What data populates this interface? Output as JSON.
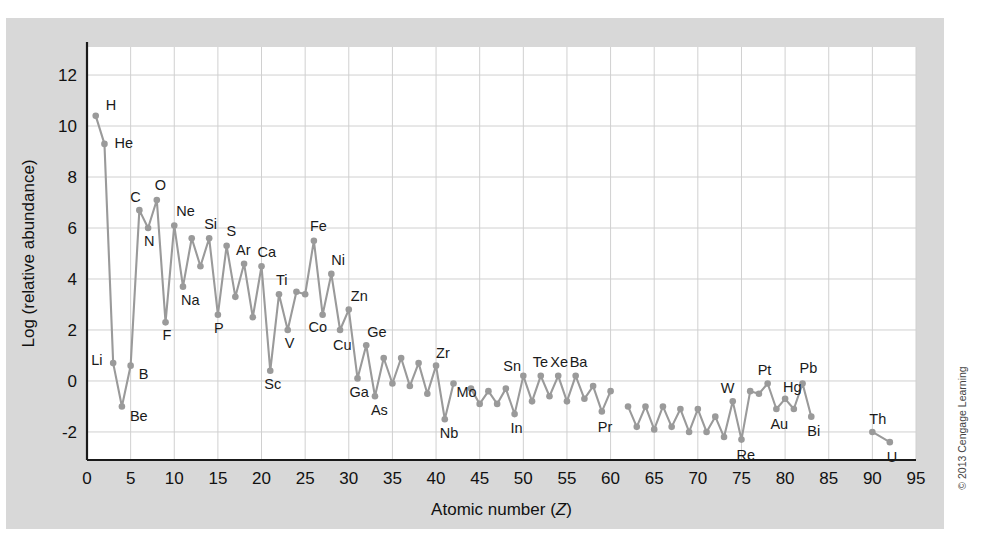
{
  "figure": {
    "credit": "© 2013 Cengage Learning",
    "background_color": "#d8d8d8",
    "plot_background_color": "#ffffff",
    "series_color": "#9a9a9a",
    "grid_color": "#d0d0d0",
    "axis_color": "#1a1a1a"
  },
  "chart_data": {
    "type": "line",
    "title": "",
    "subtitle": "",
    "xlabel": "Atomic number (Z)",
    "ylabel": "Log (relative abundance)",
    "xlim": [
      0,
      95
    ],
    "ylim": [
      -3.1,
      13.1
    ],
    "xticks": [
      0,
      5,
      10,
      15,
      20,
      25,
      30,
      35,
      40,
      45,
      50,
      55,
      60,
      65,
      70,
      75,
      80,
      85,
      90,
      95
    ],
    "yticks": [
      -2,
      0,
      2,
      4,
      6,
      8,
      10,
      12
    ],
    "grid": true,
    "legend": "none",
    "marker": "circle",
    "series": [
      {
        "name": "Solar system abundance",
        "x": [
          1,
          2,
          3,
          4,
          5,
          6,
          7,
          8,
          9,
          10,
          11,
          12,
          13,
          14,
          15,
          16,
          17,
          18,
          19,
          20,
          21,
          22,
          23,
          24,
          25,
          26,
          27,
          28,
          29,
          30,
          31,
          32,
          33,
          34,
          35,
          36,
          37,
          38,
          39,
          40,
          41,
          42
        ],
        "values": [
          10.4,
          9.3,
          0.7,
          -1.0,
          0.6,
          6.7,
          6.0,
          7.1,
          2.3,
          6.1,
          3.7,
          5.6,
          4.5,
          5.6,
          2.6,
          5.3,
          3.3,
          4.6,
          2.5,
          4.5,
          0.4,
          3.4,
          2.0,
          3.5,
          3.4,
          5.5,
          2.6,
          4.2,
          2.0,
          2.8,
          0.1,
          1.4,
          -0.6,
          0.9,
          -0.1,
          0.9,
          -0.2,
          0.7,
          -0.5,
          0.6,
          -1.5,
          -0.1
        ]
      },
      {
        "name": "Solar system abundance (continued)",
        "x": [
          44,
          45,
          46,
          47,
          48,
          49,
          50,
          51,
          52,
          53,
          54,
          55,
          56,
          57,
          58,
          59,
          60
        ],
        "values": [
          -0.3,
          -0.9,
          -0.4,
          -0.9,
          -0.3,
          -1.3,
          0.2,
          -0.8,
          0.2,
          -0.6,
          0.2,
          -0.8,
          0.2,
          -0.7,
          -0.2,
          -1.2,
          -0.4
        ]
      },
      {
        "name": "Solar system abundance (lanthanides)",
        "x": [
          62,
          63,
          64,
          65,
          66,
          67,
          68,
          69,
          70,
          71,
          72,
          73,
          74,
          75,
          76,
          77,
          78,
          79,
          80,
          81,
          82,
          83
        ],
        "values": [
          -1.0,
          -1.8,
          -1.0,
          -1.9,
          -1.0,
          -1.8,
          -1.1,
          -2.0,
          -1.1,
          -2.0,
          -1.4,
          -2.2,
          -0.8,
          -2.3,
          -0.4,
          -0.5,
          -0.1,
          -1.1,
          -0.7,
          -1.1,
          -0.1,
          -1.4
        ]
      },
      {
        "name": "Actinides",
        "x": [
          90,
          92
        ],
        "values": [
          -2.0,
          -2.4
        ]
      }
    ],
    "point_labels": [
      {
        "element": "H",
        "z": 1,
        "value": 10.4,
        "dx": 10,
        "dy": -6
      },
      {
        "element": "He",
        "z": 2,
        "value": 9.3,
        "dx": 10,
        "dy": 4
      },
      {
        "element": "Li",
        "z": 3,
        "value": 0.7,
        "dx": -22,
        "dy": 2
      },
      {
        "element": "Be",
        "z": 4,
        "value": -1.0,
        "dx": 8,
        "dy": 15
      },
      {
        "element": "B",
        "z": 5,
        "value": 0.6,
        "dx": 8,
        "dy": 13
      },
      {
        "element": "C",
        "z": 6,
        "value": 6.7,
        "dx": -9,
        "dy": -8
      },
      {
        "element": "N",
        "z": 7,
        "value": 6.0,
        "dx": -4,
        "dy": 18
      },
      {
        "element": "O",
        "z": 8,
        "value": 7.1,
        "dx": -2,
        "dy": -10
      },
      {
        "element": "F",
        "z": 9,
        "value": 2.3,
        "dx": -3,
        "dy": 18
      },
      {
        "element": "Ne",
        "z": 10,
        "value": 6.1,
        "dx": 2,
        "dy": -9
      },
      {
        "element": "Na",
        "z": 11,
        "value": 3.7,
        "dx": -2,
        "dy": 18
      },
      {
        "element": "Si",
        "z": 14,
        "value": 5.6,
        "dx": -5,
        "dy": -9
      },
      {
        "element": "P",
        "z": 15,
        "value": 2.6,
        "dx": -4,
        "dy": 18
      },
      {
        "element": "S",
        "z": 16,
        "value": 5.3,
        "dx": 0,
        "dy": -10
      },
      {
        "element": "Ar",
        "z": 18,
        "value": 4.6,
        "dx": -8,
        "dy": -9
      },
      {
        "element": "Ca",
        "z": 20,
        "value": 4.5,
        "dx": -4,
        "dy": -9
      },
      {
        "element": "Sc",
        "z": 21,
        "value": 0.4,
        "dx": -6,
        "dy": 18
      },
      {
        "element": "Ti",
        "z": 22,
        "value": 3.4,
        "dx": -3,
        "dy": -9
      },
      {
        "element": "V",
        "z": 23,
        "value": 2.0,
        "dx": -3,
        "dy": 18
      },
      {
        "element": "Fe",
        "z": 26,
        "value": 5.5,
        "dx": -4,
        "dy": -10
      },
      {
        "element": "Co",
        "z": 27,
        "value": 2.6,
        "dx": -14,
        "dy": 17
      },
      {
        "element": "Ni",
        "z": 28,
        "value": 4.2,
        "dx": 0,
        "dy": -9
      },
      {
        "element": "Cu",
        "z": 29,
        "value": 2.0,
        "dx": -7,
        "dy": 20
      },
      {
        "element": "Zn",
        "z": 30,
        "value": 2.8,
        "dx": 2,
        "dy": -9
      },
      {
        "element": "Ga",
        "z": 31,
        "value": 0.1,
        "dx": -8,
        "dy": 19
      },
      {
        "element": "Ge",
        "z": 32,
        "value": 1.4,
        "dx": 1,
        "dy": -8
      },
      {
        "element": "As",
        "z": 33,
        "value": -0.6,
        "dx": -4,
        "dy": 19
      },
      {
        "element": "Zr",
        "z": 40,
        "value": 0.6,
        "dx": 0,
        "dy": -8
      },
      {
        "element": "Nb",
        "z": 41,
        "value": -1.5,
        "dx": -5,
        "dy": 19
      },
      {
        "element": "Mo",
        "z": 42,
        "value": -0.1,
        "dx": 3,
        "dy": 13
      },
      {
        "element": "Sn",
        "z": 50,
        "value": 0.2,
        "dx": -20,
        "dy": -5
      },
      {
        "element": "In",
        "z": 49,
        "value": -1.3,
        "dx": -4,
        "dy": 19
      },
      {
        "element": "Te",
        "z": 52,
        "value": 0.2,
        "dx": -8,
        "dy": -9
      },
      {
        "element": "Xe",
        "z": 54,
        "value": 0.2,
        "dx": -8,
        "dy": -9
      },
      {
        "element": "Ba",
        "z": 56,
        "value": 0.2,
        "dx": -6,
        "dy": -9
      },
      {
        "element": "Pr",
        "z": 59,
        "value": -1.2,
        "dx": -4,
        "dy": 20
      },
      {
        "element": "W",
        "z": 74,
        "value": -0.8,
        "dx": -12,
        "dy": -8
      },
      {
        "element": "Re",
        "z": 75,
        "value": -2.3,
        "dx": -5,
        "dy": 20
      },
      {
        "element": "Pt",
        "z": 78,
        "value": -0.1,
        "dx": -10,
        "dy": -9
      },
      {
        "element": "Au",
        "z": 79,
        "value": -1.1,
        "dx": -6,
        "dy": 20
      },
      {
        "element": "Hg",
        "z": 80,
        "value": -0.7,
        "dx": -2,
        "dy": -7
      },
      {
        "element": "Pb",
        "z": 82,
        "value": -0.1,
        "dx": -3,
        "dy": -11
      },
      {
        "element": "Bi",
        "z": 83,
        "value": -1.4,
        "dx": -4,
        "dy": 19
      },
      {
        "element": "Th",
        "z": 90,
        "value": -2.0,
        "dx": -3,
        "dy": -8
      },
      {
        "element": "U",
        "z": 92,
        "value": -2.4,
        "dx": -3,
        "dy": 20
      }
    ]
  }
}
